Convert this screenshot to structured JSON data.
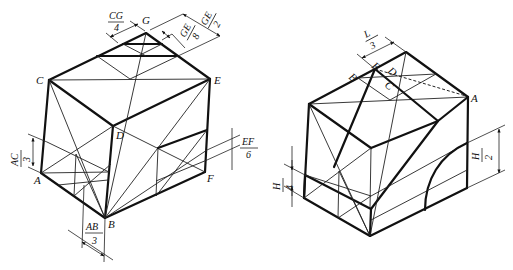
{
  "figures": [
    {
      "id": "left-cube",
      "vertex_labels": {
        "G": "G",
        "C": "C",
        "E": "E",
        "D": "D",
        "A": "A",
        "B": "B",
        "F": "F"
      },
      "dimensions": [
        {
          "num": "CG",
          "den": "4"
        },
        {
          "num": "GE",
          "den": "8"
        },
        {
          "num": "GE",
          "den": "2"
        },
        {
          "num": "AC",
          "den": "3"
        },
        {
          "num": "EF",
          "den": "6"
        },
        {
          "num": "AB",
          "den": "3"
        }
      ]
    },
    {
      "id": "right-cube",
      "vertex_labels": {
        "A": "A",
        "B": "B",
        "C": "C",
        "D": "D",
        "E": "E"
      },
      "dimensions": [
        {
          "num": "L",
          "den": "3"
        },
        {
          "num": "H",
          "den": "4"
        },
        {
          "num": "H",
          "den": "2"
        }
      ]
    }
  ]
}
